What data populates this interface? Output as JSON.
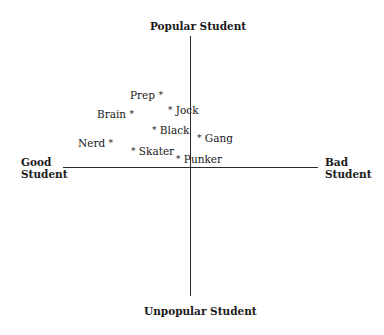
{
  "axes": {
    "top": "Popular Student",
    "bottom": "Unpopular Student",
    "left_line1": "Good",
    "left_line2": "Student",
    "right_line1": "Bad",
    "right_line2": "Student"
  },
  "marker_glyph": "*",
  "points": [
    {
      "label": "Prep",
      "side": "left"
    },
    {
      "label": "Jock",
      "side": "right"
    },
    {
      "label": "Brain",
      "side": "left"
    },
    {
      "label": "Black",
      "side": "right"
    },
    {
      "label": "Gang",
      "side": "right"
    },
    {
      "label": "Nerd",
      "side": "left"
    },
    {
      "label": "Skater",
      "side": "right"
    },
    {
      "label": "Punker",
      "side": "right"
    }
  ]
}
